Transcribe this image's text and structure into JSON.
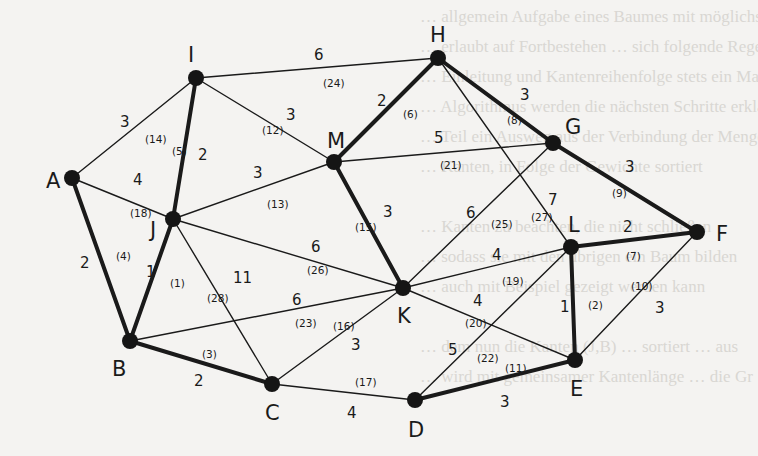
{
  "diagram": {
    "type": "weighted-undirected-graph",
    "nodes": [
      {
        "id": "A",
        "x": 72,
        "y": 178,
        "lx": 46,
        "ly": 188
      },
      {
        "id": "I",
        "x": 196,
        "y": 78,
        "lx": 188,
        "ly": 62
      },
      {
        "id": "H",
        "x": 438,
        "y": 58,
        "lx": 430,
        "ly": 42
      },
      {
        "id": "M",
        "x": 334,
        "y": 162,
        "lx": 327,
        "ly": 148
      },
      {
        "id": "G",
        "x": 553,
        "y": 143,
        "lx": 565,
        "ly": 134
      },
      {
        "id": "F",
        "x": 697,
        "y": 232,
        "lx": 716,
        "ly": 241
      },
      {
        "id": "J",
        "x": 173,
        "y": 219,
        "lx": 150,
        "ly": 237
      },
      {
        "id": "L",
        "x": 571,
        "y": 247,
        "lx": 568,
        "ly": 232
      },
      {
        "id": "K",
        "x": 403,
        "y": 288,
        "lx": 397,
        "ly": 323
      },
      {
        "id": "B",
        "x": 130,
        "y": 341,
        "lx": 112,
        "ly": 376
      },
      {
        "id": "C",
        "x": 272,
        "y": 384,
        "lx": 265,
        "ly": 420
      },
      {
        "id": "D",
        "x": 415,
        "y": 400,
        "lx": 408,
        "ly": 437
      },
      {
        "id": "E",
        "x": 575,
        "y": 360,
        "lx": 570,
        "ly": 396
      }
    ],
    "edges": [
      {
        "from": "J",
        "to": "B",
        "weight": "1",
        "order": "(1)",
        "bold": true,
        "wx": 146,
        "wy": 277,
        "ox": 170,
        "oy": 287
      },
      {
        "from": "L",
        "to": "E",
        "weight": "1",
        "order": "(2)",
        "bold": true,
        "wx": 560,
        "wy": 312,
        "ox": 588,
        "oy": 309
      },
      {
        "from": "B",
        "to": "C",
        "weight": "2",
        "order": "(3)",
        "bold": true,
        "wx": 194,
        "wy": 386,
        "ox": 202,
        "oy": 358
      },
      {
        "from": "A",
        "to": "B",
        "weight": "2",
        "order": "(4)",
        "bold": true,
        "wx": 80,
        "wy": 268,
        "ox": 116,
        "oy": 260
      },
      {
        "from": "I",
        "to": "J",
        "weight": "2",
        "order": "(5)",
        "bold": true,
        "wx": 198,
        "wy": 160,
        "ox": 172,
        "oy": 155
      },
      {
        "from": "M",
        "to": "H",
        "weight": "2",
        "order": "(6)",
        "bold": true,
        "wx": 377,
        "wy": 106,
        "ox": 403,
        "oy": 118
      },
      {
        "from": "L",
        "to": "F",
        "weight": "2",
        "order": "(7)",
        "bold": true,
        "wx": 623,
        "wy": 232,
        "ox": 626,
        "oy": 260
      },
      {
        "from": "H",
        "to": "G",
        "weight": "3",
        "order": "(8)",
        "bold": true,
        "wx": 520,
        "wy": 100,
        "ox": 507,
        "oy": 124
      },
      {
        "from": "G",
        "to": "F",
        "weight": "3",
        "order": "(9)",
        "bold": true,
        "wx": 625,
        "wy": 172,
        "ox": 612,
        "oy": 197
      },
      {
        "from": "E",
        "to": "F",
        "weight": "3",
        "order": "(10)",
        "bold": false,
        "wx": 655,
        "wy": 313,
        "ox": 631,
        "oy": 290
      },
      {
        "from": "D",
        "to": "E",
        "weight": "3",
        "order": "(11)",
        "bold": true,
        "wx": 500,
        "wy": 407,
        "ox": 505,
        "oy": 372
      },
      {
        "from": "I",
        "to": "M",
        "weight": "3",
        "order": "(12)",
        "bold": false,
        "wx": 286,
        "wy": 120,
        "ox": 262,
        "oy": 134
      },
      {
        "from": "J",
        "to": "M",
        "weight": "3",
        "order": "(13)",
        "bold": false,
        "wx": 253,
        "wy": 178,
        "ox": 267,
        "oy": 208
      },
      {
        "from": "A",
        "to": "I",
        "weight": "3",
        "order": "(14)",
        "bold": false,
        "wx": 120,
        "wy": 127,
        "ox": 145,
        "oy": 143
      },
      {
        "from": "M",
        "to": "K",
        "weight": "3",
        "order": "(15)",
        "bold": true,
        "wx": 383,
        "wy": 217,
        "ox": 355,
        "oy": 231
      },
      {
        "from": "C",
        "to": "K",
        "weight": "3",
        "order": "(16)",
        "bold": false,
        "wx": 351,
        "wy": 350,
        "ox": 333,
        "oy": 330
      },
      {
        "from": "C",
        "to": "D",
        "weight": "4",
        "order": "(17)",
        "bold": false,
        "wx": 347,
        "wy": 418,
        "ox": 355,
        "oy": 386
      },
      {
        "from": "A",
        "to": "J",
        "weight": "4",
        "order": "(18)",
        "bold": false,
        "wx": 133,
        "wy": 185,
        "ox": 130,
        "oy": 217
      },
      {
        "from": "K",
        "to": "L",
        "weight": "4",
        "order": "(19)",
        "bold": false,
        "wx": 492,
        "wy": 260,
        "ox": 502,
        "oy": 285
      },
      {
        "from": "K",
        "to": "E",
        "weight": "4",
        "order": "(20)",
        "bold": false,
        "wx": 473,
        "wy": 306,
        "ox": 465,
        "oy": 327
      },
      {
        "from": "M",
        "to": "G",
        "weight": "5",
        "order": "(21)",
        "bold": false,
        "wx": 434,
        "wy": 143,
        "ox": 440,
        "oy": 169
      },
      {
        "from": "D",
        "to": "L",
        "weight": "5",
        "order": "(22)",
        "bold": false,
        "wx": 448,
        "wy": 355,
        "ox": 477,
        "oy": 362
      },
      {
        "from": "B",
        "to": "K",
        "weight": "6",
        "order": "(23)",
        "bold": false,
        "wx": 292,
        "wy": 305,
        "ox": 295,
        "oy": 327
      },
      {
        "from": "I",
        "to": "H",
        "weight": "6",
        "order": "(24)",
        "bold": false,
        "wx": 314,
        "wy": 60,
        "ox": 323,
        "oy": 87
      },
      {
        "from": "K",
        "to": "G",
        "weight": "6",
        "order": "(25)",
        "bold": false,
        "wx": 466,
        "wy": 218,
        "ox": 491,
        "oy": 228
      },
      {
        "from": "J",
        "to": "K",
        "weight": "6",
        "order": "(26)",
        "bold": false,
        "wx": 311,
        "wy": 252,
        "ox": 307,
        "oy": 274
      },
      {
        "from": "H",
        "to": "L",
        "weight": "7",
        "order": "(27)",
        "bold": false,
        "wx": 548,
        "wy": 205,
        "ox": 531,
        "oy": 221
      },
      {
        "from": "J",
        "to": "C",
        "weight": "11",
        "order": "(28)",
        "bold": false,
        "wx": 233,
        "wy": 283,
        "ox": 207,
        "oy": 302
      }
    ]
  },
  "background_text": [
    "… allgemein Aufgabe eines Baumes mit möglichst",
    "… erlaubt auf Fortbestehen … sich folgende Regel",
    "… Einleitung und Kantenreihenfolge stets ein Maß",
    "… Algorithmus werden die nächsten Schritte erklärt",
    "… Teil ein Ausweg aus der Verbindung der Menge",
    "… Kanten, in Folge der Gewichte sortiert",
    "",
    "… Kanten zu beachten, die nicht schließen",
    "… sodass sie mit den übrigen ein Baum bilden",
    "… auch mit Beispiel gezeigt werden kann",
    "",
    "… dem nun die Kanten (J,B) … sortiert … aus",
    "… wird mit gemeinsamer Kantenlänge … die Gr"
  ]
}
